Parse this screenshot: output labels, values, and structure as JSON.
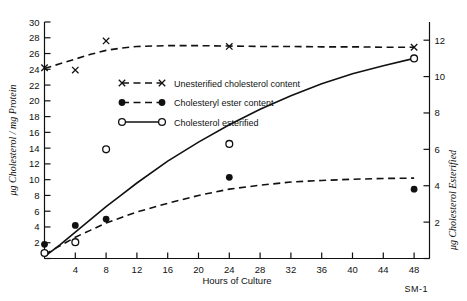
{
  "figure": {
    "corner_label": "SM-1"
  },
  "chart_data": {
    "type": "line",
    "title": "",
    "xlabel": "Hours of Culture",
    "ylabel": "μg Cholesterol / mg Protein",
    "y2label": "μg Cholesterol Esterified",
    "xlim": [
      0,
      50
    ],
    "ylim": [
      0,
      30
    ],
    "y2lim": [
      0,
      13
    ],
    "xticks": [
      4,
      8,
      12,
      16,
      20,
      24,
      28,
      32,
      36,
      40,
      44,
      48
    ],
    "xtick_labels": [
      "4",
      "8",
      "12",
      "16",
      "20",
      "24",
      "28",
      "32",
      "36",
      "40",
      "44",
      "48"
    ],
    "yticks": [
      0,
      2,
      4,
      6,
      8,
      10,
      12,
      14,
      16,
      18,
      20,
      22,
      24,
      26,
      28,
      30
    ],
    "ytick_labels": [
      "",
      "2",
      "4",
      "6",
      "8",
      "10",
      "12",
      "14",
      "16",
      "18",
      "20",
      "22",
      "24",
      "26",
      "28",
      "30"
    ],
    "y2ticks": [
      0,
      2,
      4,
      6,
      8,
      10,
      12
    ],
    "y2tick_labels": [
      "",
      "2",
      "4",
      "6",
      "8",
      "10",
      "12"
    ],
    "grid": false,
    "legend_position": "upper-center",
    "series": [
      {
        "name": "Unesterified cholesterol content",
        "marker": "x",
        "line": "dashed",
        "axis": "left",
        "x": [
          0,
          4,
          8,
          24,
          48
        ],
        "values": [
          24.2,
          23.9,
          27.6,
          26.9,
          26.8
        ],
        "curve_x": [
          0,
          2,
          4,
          6,
          8,
          10,
          12,
          16,
          20,
          24,
          28,
          32,
          36,
          40,
          44,
          48
        ],
        "curve_y": [
          24.1,
          24.7,
          25.3,
          25.9,
          26.4,
          26.7,
          26.9,
          27.0,
          27.0,
          26.95,
          26.9,
          26.9,
          26.85,
          26.85,
          26.8,
          26.8
        ]
      },
      {
        "name": "Cholesteryl ester content",
        "marker": "filled-circle",
        "line": "dashed",
        "axis": "left",
        "x": [
          0,
          4,
          8,
          24,
          48
        ],
        "values": [
          1.8,
          4.2,
          5.0,
          10.3,
          8.8
        ],
        "curve_x": [
          0,
          2,
          4,
          6,
          8,
          10,
          12,
          16,
          20,
          24,
          28,
          32,
          36,
          40,
          44,
          48
        ],
        "curve_y": [
          0.5,
          1.6,
          2.7,
          3.6,
          4.5,
          5.2,
          5.9,
          7.0,
          8.0,
          8.8,
          9.3,
          9.7,
          9.9,
          10.05,
          10.15,
          10.2
        ]
      },
      {
        "name": "Cholesterol esterified",
        "marker": "open-circle",
        "line": "solid",
        "axis": "right",
        "x": [
          0,
          4,
          8,
          24,
          48
        ],
        "values": [
          0.3,
          0.9,
          6.0,
          6.3,
          11.0
        ],
        "curve_x": [
          0,
          2,
          4,
          6,
          8,
          10,
          12,
          16,
          20,
          24,
          28,
          32,
          36,
          40,
          44,
          48
        ],
        "curve_y": [
          0.1,
          0.75,
          1.45,
          2.15,
          2.85,
          3.5,
          4.15,
          5.35,
          6.4,
          7.35,
          8.2,
          8.95,
          9.6,
          10.15,
          10.6,
          11.0
        ]
      }
    ]
  },
  "legend": {
    "items": [
      {
        "label": "Unesterified  cholesterol  content",
        "marker": "x",
        "line": "dashed"
      },
      {
        "label": "Cholesteryl  ester  content",
        "marker": "filled-circle",
        "line": "dashed"
      },
      {
        "label": "Cholesterol  esterified",
        "marker": "open-circle",
        "line": "solid"
      }
    ]
  }
}
